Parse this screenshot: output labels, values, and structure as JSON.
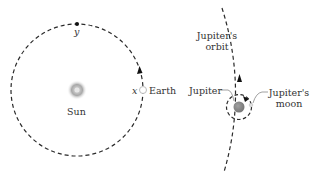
{
  "labels": {
    "sun": "Sun",
    "earth": "Earth",
    "point_x": "x",
    "point_y": "y",
    "jupiter_orbit_line1": "Jupiter's",
    "jupiter_orbit_line2": "orbit",
    "jupiter": "Jupiter",
    "jupiter_moon_line1": "Jupiter's",
    "jupiter_moon_line2": "moon"
  },
  "colors": {
    "orbit_line": "#2a2a2a",
    "sun_glow": "#9a9a9a",
    "jupiter_fill": "#8a8a8a",
    "text": "#333333"
  }
}
